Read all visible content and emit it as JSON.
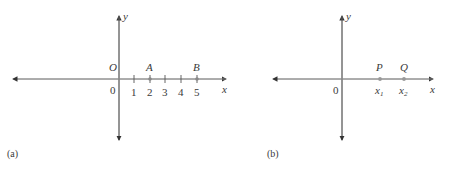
{
  "panel_a": {
    "caption": "(a)",
    "x_axis_label": "x",
    "y_axis_label": "y",
    "origin_label": "O",
    "origin_value": "0",
    "tick_labels": [
      "1",
      "2",
      "3",
      "4",
      "5"
    ],
    "points": [
      {
        "name": "A",
        "x": 2
      },
      {
        "name": "B",
        "x": 5
      }
    ]
  },
  "panel_b": {
    "caption": "(b)",
    "x_axis_label": "x",
    "y_axis_label": "y",
    "origin_value": "0",
    "points": [
      {
        "name": "P",
        "coord": "x",
        "subscript": "1"
      },
      {
        "name": "Q",
        "coord": "x",
        "subscript": "2"
      }
    ]
  },
  "colors": {
    "axis": "#555555",
    "point": "#888888",
    "text": "#3a3a3a"
  }
}
